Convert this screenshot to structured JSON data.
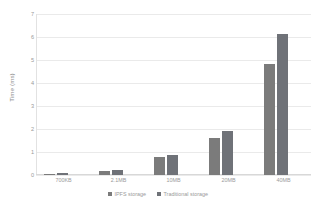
{
  "chart_data": {
    "type": "bar",
    "title": "",
    "xlabel": "",
    "ylabel": "Time (ms)",
    "ylim": [
      0,
      7
    ],
    "yticks": [
      "0",
      "1",
      "2",
      "3",
      "4",
      "5",
      "6",
      "7"
    ],
    "grid": true,
    "legend_position": "bottom-center",
    "categories": [
      "700KB",
      "2.1MB",
      "10MB",
      "20MB",
      "40MB"
    ],
    "series": [
      {
        "name": "IPFS storage",
        "color": "#7b7b7b",
        "values": [
          0.05,
          0.17,
          0.79,
          1.62,
          4.82
        ]
      },
      {
        "name": "Traditional storage",
        "color": "#6f7278",
        "values": [
          0.09,
          0.22,
          0.85,
          1.93,
          6.12
        ]
      }
    ]
  },
  "colors": {
    "background": "#ffffff",
    "gridline": "#eaeaea",
    "axis": "#d8d8d8",
    "tick_text": "#9a9a9a",
    "axis_title_text": "#8d8d8d"
  }
}
